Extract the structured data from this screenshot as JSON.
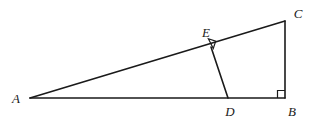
{
  "figure": {
    "type": "geometry-diagram",
    "width": 314,
    "height": 121,
    "background_color": "#ffffff",
    "stroke_color": "#1a1a1a",
    "stroke_width": 1.6,
    "label_color": "#1a1a1a"
  },
  "points": [
    {
      "id": "A",
      "label": "A",
      "x": 30,
      "y": 98,
      "label_x": 16,
      "label_y": 98
    },
    {
      "id": "B",
      "label": "B",
      "x": 285,
      "y": 98,
      "label_x": 292,
      "label_y": 111
    },
    {
      "id": "C",
      "label": "C",
      "x": 285,
      "y": 21,
      "label_x": 298,
      "label_y": 13
    },
    {
      "id": "D",
      "label": "D",
      "x": 228,
      "y": 98,
      "label_x": 230,
      "label_y": 111
    },
    {
      "id": "E",
      "label": "E",
      "x": 211,
      "y": 47,
      "label_x": 206,
      "label_y": 32
    }
  ],
  "segments": [
    {
      "id": "AC",
      "from": "A",
      "to": "C",
      "points": "30,98 285,21"
    },
    {
      "id": "AB",
      "from": "A",
      "to": "B",
      "points": "30,98 285,98"
    },
    {
      "id": "CB",
      "from": "C",
      "to": "B",
      "points": "285,21 285,98"
    },
    {
      "id": "ED",
      "from": "E",
      "to": "D",
      "points": "211,47 228,98"
    }
  ],
  "right_angles": [
    {
      "id": "angle-at-B",
      "at": "B",
      "marker": "right-angle-square",
      "points": "277.5,98 277.5,90.5 285,90.5"
    },
    {
      "id": "angle-at-E",
      "at": "E",
      "marker": "right-angle-square",
      "points": "208.4,38.7 215.7,41.1 213.3,48.5"
    }
  ]
}
